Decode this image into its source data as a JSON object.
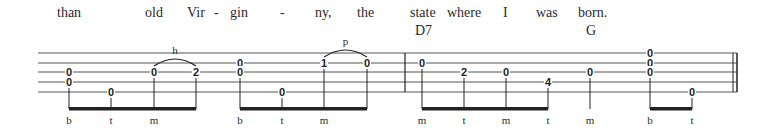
{
  "lyrics": [
    {
      "text": "than",
      "x": 57
    },
    {
      "text": "old",
      "x": 145
    },
    {
      "text": "Vir",
      "x": 187
    },
    {
      "text": "-",
      "x": 214
    },
    {
      "text": "gin",
      "x": 230
    },
    {
      "text": "-",
      "x": 280
    },
    {
      "text": "ny,",
      "x": 315
    },
    {
      "text": "the",
      "x": 357
    },
    {
      "text": "state",
      "x": 410
    },
    {
      "text": "where",
      "x": 447
    },
    {
      "text": "I",
      "x": 503
    },
    {
      "text": "was",
      "x": 536
    },
    {
      "text": "born.",
      "x": 578
    }
  ],
  "chords": [
    {
      "name": "D7",
      "x": 415
    },
    {
      "name": "G",
      "x": 586
    }
  ],
  "staff": {
    "x_start": 38,
    "x_end": 737,
    "lines_y": [
      53,
      63,
      72,
      82,
      92
    ],
    "barlines": [
      405
    ],
    "final_barline": [
      733,
      737
    ]
  },
  "measures": [
    {
      "notes": [
        {
          "x": 69,
          "frets": [
            {
              "string": 3,
              "fret": "0"
            },
            {
              "string": 4,
              "fret": "0"
            }
          ],
          "finger": "b"
        },
        {
          "x": 111,
          "frets": [
            {
              "string": 5,
              "fret": "0"
            }
          ],
          "finger": "t"
        },
        {
          "x": 154,
          "frets": [
            {
              "string": 3,
              "fret": "0"
            }
          ],
          "finger": "m"
        },
        {
          "x": 196,
          "frets": [
            {
              "string": 3,
              "fret": "2"
            }
          ],
          "finger": ""
        }
      ],
      "beams": [
        [
          69,
          196
        ]
      ],
      "slurs": [
        {
          "from": 154,
          "to": 196,
          "string": 3,
          "label": "h"
        }
      ]
    },
    {
      "notes": [
        {
          "x": 240,
          "frets": [
            {
              "string": 2,
              "fret": "0"
            },
            {
              "string": 3,
              "fret": "0"
            }
          ],
          "finger": "b"
        },
        {
          "x": 282,
          "frets": [
            {
              "string": 5,
              "fret": "0"
            }
          ],
          "finger": "t"
        },
        {
          "x": 324,
          "frets": [
            {
              "string": 2,
              "fret": "1"
            }
          ],
          "finger": "m"
        },
        {
          "x": 367,
          "frets": [
            {
              "string": 2,
              "fret": "0"
            }
          ],
          "finger": ""
        }
      ],
      "beams": [
        [
          240,
          367
        ]
      ],
      "slurs": [
        {
          "from": 324,
          "to": 367,
          "string": 2,
          "label": "p"
        }
      ]
    },
    {
      "notes": [
        {
          "x": 422,
          "frets": [
            {
              "string": 2,
              "fret": "0"
            }
          ],
          "finger": "m"
        },
        {
          "x": 464,
          "frets": [
            {
              "string": 3,
              "fret": "2"
            }
          ],
          "finger": "t"
        },
        {
          "x": 506,
          "frets": [
            {
              "string": 3,
              "fret": "0"
            }
          ],
          "finger": "m"
        },
        {
          "x": 548,
          "frets": [
            {
              "string": 4,
              "fret": "4"
            }
          ],
          "finger": "t"
        }
      ],
      "beams": [
        [
          422,
          548
        ]
      ],
      "slurs": []
    },
    {
      "notes": [
        {
          "x": 590,
          "frets": [
            {
              "string": 3,
              "fret": "0"
            }
          ],
          "finger": "m"
        },
        {
          "x": 650,
          "frets": [
            {
              "string": 1,
              "fret": "0"
            },
            {
              "string": 2,
              "fret": "0"
            },
            {
              "string": 3,
              "fret": "0"
            }
          ],
          "finger": "b"
        },
        {
          "x": 692,
          "frets": [
            {
              "string": 5,
              "fret": "0"
            }
          ],
          "finger": "t"
        }
      ],
      "beams": [
        [
          650,
          692
        ]
      ],
      "slurs": []
    }
  ],
  "layout": {
    "lyric_y": 17,
    "chord_y": 35,
    "beam_y": 109,
    "finger_y": 124,
    "colors": {
      "ink": "#222222",
      "staff": "#555555"
    }
  }
}
